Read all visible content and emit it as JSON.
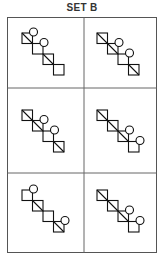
{
  "title": "SET B",
  "grid": {
    "rows": 3,
    "cols": 2
  },
  "cells": [
    {
      "id": 1,
      "squares": [
        {
          "diag": true,
          "circle": true
        },
        {
          "diag": false,
          "circle": true
        },
        {
          "diag": true,
          "circle": false
        },
        {
          "diag": false,
          "circle": false
        }
      ]
    },
    {
      "id": 2,
      "squares": [
        {
          "diag": true,
          "circle": false
        },
        {
          "diag": true,
          "circle": true
        },
        {
          "diag": false,
          "circle": true
        },
        {
          "diag": true,
          "circle": false
        }
      ]
    },
    {
      "id": 3,
      "squares": [
        {
          "diag": true,
          "circle": false
        },
        {
          "diag": true,
          "circle": true
        },
        {
          "diag": false,
          "circle": true
        },
        {
          "diag": true,
          "circle": false
        }
      ]
    },
    {
      "id": 4,
      "squares": [
        {
          "diag": true,
          "circle": false
        },
        {
          "diag": true,
          "circle": false
        },
        {
          "diag": true,
          "circle": true
        },
        {
          "diag": false,
          "circle": true
        }
      ]
    },
    {
      "id": 5,
      "squares": [
        {
          "diag": false,
          "circle": true
        },
        {
          "diag": true,
          "circle": false
        },
        {
          "diag": false,
          "circle": false
        },
        {
          "diag": true,
          "circle": true
        }
      ]
    },
    {
      "id": 6,
      "squares": [
        {
          "diag": true,
          "circle": false
        },
        {
          "diag": true,
          "circle": false
        },
        {
          "diag": true,
          "circle": true
        },
        {
          "diag": false,
          "circle": true
        }
      ]
    }
  ]
}
